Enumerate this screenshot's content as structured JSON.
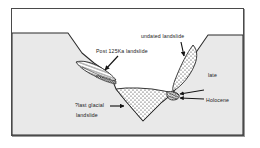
{
  "figure": {
    "type": "geologic-cross-section",
    "title": "",
    "frame": {
      "border_color": "#4a4a4a",
      "background": "#ffffff"
    },
    "colors": {
      "bedrock_fill": "#e9e9e9",
      "sky_fill": "#ffffff",
      "line": "#2b2b2b",
      "stipple": "#262626",
      "text": "#1a1a1a"
    }
  },
  "labels": {
    "post_125ka": "Post 125Ka landslide",
    "undated": "undated landslide",
    "late": "late",
    "holocene": "Holocene",
    "last_glacial": "?last glacial",
    "landslide": "landslide"
  },
  "units": [
    {
      "name": "bedrock",
      "pattern": "solid-gray"
    },
    {
      "name": "post-125ka-landslide",
      "pattern": "hatched-lens",
      "position": "left-valley-wall"
    },
    {
      "name": "undated-landslide",
      "pattern": "stippled-lens",
      "position": "right-valley-wall"
    },
    {
      "name": "last-glacial-landslide-fill",
      "pattern": "stippled-wedge",
      "position": "valley-floor"
    },
    {
      "name": "late-holocene-deposit",
      "pattern": "dark-stipple",
      "position": "right-valley-floor"
    }
  ],
  "annotations": [
    {
      "name": "arrow-post-125ka",
      "direction": "down-left",
      "target": "post-125ka-landslide"
    },
    {
      "name": "arrow-undated",
      "direction": "down",
      "target": "undated-landslide"
    },
    {
      "name": "arrow-last-glacial",
      "direction": "right",
      "target": "valley-fill"
    },
    {
      "name": "arrow-late",
      "direction": "left",
      "target": "late-holocene-deposit"
    },
    {
      "name": "arrow-holocene",
      "direction": "left",
      "target": "late-holocene-deposit"
    }
  ]
}
